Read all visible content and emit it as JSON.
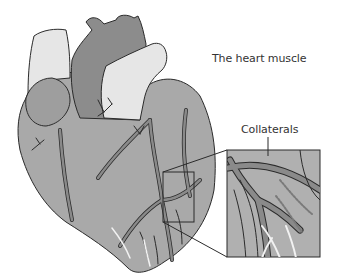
{
  "labels": {
    "heart_muscle": "The heart muscle",
    "collaterals": "Collaterals"
  },
  "colors": {
    "muscle": "#a9a9a9",
    "dark_chamber": "#8c8c8c",
    "aorta_light": "#e6e6e6",
    "vessel": "#8a8a8a",
    "vessel_light": "#f2f2f2",
    "outline": "#2b2b2b",
    "inset_bg": "#b0b0b0"
  }
}
